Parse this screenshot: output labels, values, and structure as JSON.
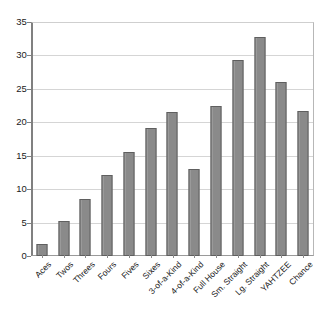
{
  "chart_data": {
    "type": "bar",
    "title": "",
    "subtitle": "",
    "xlabel": "",
    "ylabel": "",
    "categories": [
      "Aces",
      "Twos",
      "Threes",
      "Fours",
      "Fives",
      "Sixes",
      "3-of-a-Kind",
      "4-of-a-Kind",
      "Full House",
      "Sm. Straight",
      "Lg. Straight",
      "YAHTZEE",
      "Chance"
    ],
    "values": [
      1.8,
      5.2,
      8.6,
      12.1,
      15.6,
      19.1,
      21.5,
      13.0,
      22.4,
      29.3,
      32.7,
      26.1,
      21.7
    ],
    "ylim": [
      0,
      35
    ],
    "ytick_labels": [
      "0",
      "5",
      "10",
      "15",
      "20",
      "25",
      "30",
      "35"
    ],
    "ytick_values": [
      0,
      5,
      10,
      15,
      20,
      25,
      30,
      35
    ],
    "grid": "horizontal",
    "legend": "none",
    "legend_position": "none",
    "annotations": [],
    "colors": {
      "bar_fill": "#8c8c8c",
      "bar_edge": "#5f5f5f",
      "gridline": "#d5d5d5",
      "axis": "#808080",
      "background": "#ffffff",
      "text": "#1a1a1a"
    }
  }
}
